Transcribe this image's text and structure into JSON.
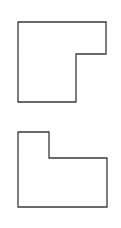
{
  "diagram": {
    "background": "#ffffff",
    "stroke_color": "#3a3a3a",
    "shapes": [
      {
        "name": "l-shape-top",
        "description": "L-shaped polygon with notch cut from lower-right",
        "points": "18,22 106,22 106,54 76,54 76,102 18,102"
      },
      {
        "name": "l-shape-bottom",
        "description": "L-shaped polygon with notch cut from upper-right",
        "points": "18,132 49,132 49,158 107,158 107,207 18,207"
      }
    ]
  }
}
